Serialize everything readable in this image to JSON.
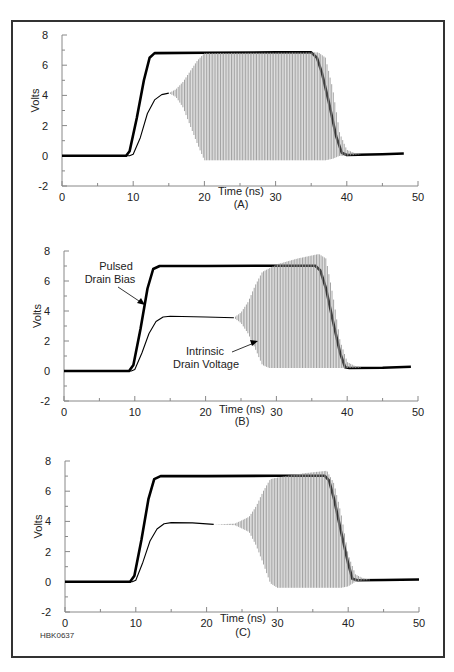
{
  "figure_id": "HBK0637",
  "chart_data": [
    {
      "type": "line",
      "panel": "(A)",
      "xlabel": "Time (ns)",
      "ylabel": "Volts",
      "xlim": [
        0,
        50
      ],
      "ylim": [
        -2,
        8
      ],
      "xticks": [
        0,
        10,
        20,
        30,
        40,
        50
      ],
      "yticks": [
        -2,
        0,
        2,
        4,
        6,
        8
      ],
      "grid": false,
      "series": [
        {
          "name": "Pulsed Drain Bias",
          "style": "thick-black",
          "points": [
            [
              0,
              0
            ],
            [
              9,
              0
            ],
            [
              9.5,
              0.3
            ],
            [
              10.5,
              2.5
            ],
            [
              11.5,
              5
            ],
            [
              12.3,
              6.5
            ],
            [
              13,
              6.8
            ],
            [
              20,
              6.82
            ],
            [
              30,
              6.85
            ],
            [
              35,
              6.85
            ],
            [
              35.8,
              6.5
            ],
            [
              36.5,
              5.5
            ],
            [
              37.5,
              3.5
            ],
            [
              38.5,
              1.3
            ],
            [
              39.3,
              0.2
            ],
            [
              40,
              0.05
            ],
            [
              45,
              0.1
            ],
            [
              48,
              0.15
            ]
          ]
        },
        {
          "name": "Intrinsic Drain Voltage",
          "style": "thin-black",
          "points": [
            [
              0,
              0
            ],
            [
              9.5,
              0
            ],
            [
              10,
              0.1
            ],
            [
              11,
              1.2
            ],
            [
              12,
              2.8
            ],
            [
              13,
              3.7
            ],
            [
              14,
              4.05
            ],
            [
              15,
              4.15
            ]
          ]
        },
        {
          "name": "Intrinsic Drain Voltage (oscillation envelope)",
          "style": "gray-oscillation",
          "upper": [
            [
              15,
              4.15
            ],
            [
              16,
              4.4
            ],
            [
              17,
              4.9
            ],
            [
              18,
              5.6
            ],
            [
              19,
              6.3
            ],
            [
              20,
              6.8
            ],
            [
              36,
              6.85
            ],
            [
              37,
              6.5
            ],
            [
              38,
              4.5
            ],
            [
              39,
              1.5
            ],
            [
              40,
              0.4
            ],
            [
              41,
              0.2
            ],
            [
              42,
              0.12
            ]
          ],
          "lower": [
            [
              15,
              4.15
            ],
            [
              16,
              3.9
            ],
            [
              17,
              3.2
            ],
            [
              18,
              2.0
            ],
            [
              19,
              0.8
            ],
            [
              20,
              -0.3
            ],
            [
              37,
              -0.3
            ],
            [
              38,
              -0.2
            ],
            [
              39,
              0.0
            ],
            [
              40,
              0.0
            ],
            [
              41,
              0.05
            ],
            [
              42,
              0.1
            ]
          ]
        }
      ]
    },
    {
      "type": "line",
      "panel": "(B)",
      "xlabel": "Time (ns)",
      "ylabel": "Volts",
      "xlim": [
        0,
        50
      ],
      "ylim": [
        -2,
        8
      ],
      "xticks": [
        0,
        10,
        20,
        30,
        40,
        50
      ],
      "yticks": [
        -2,
        0,
        2,
        4,
        6,
        8
      ],
      "grid": false,
      "annotations": [
        {
          "text": [
            "Pulsed",
            "Drain Bias"
          ],
          "target": "Pulsed Drain Bias"
        },
        {
          "text": [
            "Intrinsic",
            "Drain Voltage"
          ],
          "target": "Intrinsic Drain Voltage"
        }
      ],
      "series": [
        {
          "name": "Pulsed Drain Bias",
          "style": "thick-black",
          "points": [
            [
              0,
              0
            ],
            [
              9.2,
              0
            ],
            [
              9.8,
              0.4
            ],
            [
              10.8,
              2.8
            ],
            [
              11.8,
              5.5
            ],
            [
              12.6,
              6.8
            ],
            [
              13.5,
              7.0
            ],
            [
              20,
              7.0
            ],
            [
              30,
              7.02
            ],
            [
              35.5,
              7.02
            ],
            [
              36.2,
              6.7
            ],
            [
              37,
              5.5
            ],
            [
              38,
              3.3
            ],
            [
              39,
              1.2
            ],
            [
              39.7,
              0.25
            ],
            [
              40.3,
              0.2
            ],
            [
              45,
              0.22
            ],
            [
              49,
              0.28
            ]
          ]
        },
        {
          "name": "Intrinsic Drain Voltage",
          "style": "thin-black",
          "points": [
            [
              0,
              0
            ],
            [
              9.5,
              0
            ],
            [
              10,
              0.1
            ],
            [
              11,
              1.2
            ],
            [
              12,
              2.5
            ],
            [
              13,
              3.3
            ],
            [
              14,
              3.6
            ],
            [
              15,
              3.65
            ],
            [
              20,
              3.6
            ],
            [
              24,
              3.55
            ]
          ]
        },
        {
          "name": "Intrinsic Drain Voltage (oscillation envelope)",
          "style": "gray-oscillation",
          "upper": [
            [
              24,
              3.55
            ],
            [
              25,
              3.9
            ],
            [
              26,
              4.6
            ],
            [
              27,
              5.7
            ],
            [
              28,
              6.6
            ],
            [
              30,
              7.1
            ],
            [
              33,
              7.5
            ],
            [
              36,
              7.8
            ],
            [
              37,
              7.5
            ],
            [
              38,
              5.0
            ],
            [
              39,
              2.0
            ],
            [
              40,
              0.6
            ],
            [
              41,
              0.35
            ],
            [
              42,
              0.25
            ]
          ],
          "lower": [
            [
              24,
              3.55
            ],
            [
              25,
              3.2
            ],
            [
              26,
              2.5
            ],
            [
              27,
              1.5
            ],
            [
              28,
              0.4
            ],
            [
              29,
              0.2
            ],
            [
              38,
              0.2
            ],
            [
              39,
              0.2
            ],
            [
              40,
              0.2
            ],
            [
              41,
              0.2
            ],
            [
              42,
              0.22
            ]
          ]
        }
      ]
    },
    {
      "type": "line",
      "panel": "(C)",
      "xlabel": "Time (ns)",
      "ylabel": "Volts",
      "xlim": [
        0,
        50
      ],
      "ylim": [
        -2,
        8
      ],
      "xticks": [
        0,
        10,
        20,
        30,
        40,
        50
      ],
      "yticks": [
        -2,
        0,
        2,
        4,
        6,
        8
      ],
      "grid": false,
      "series": [
        {
          "name": "Pulsed Drain Bias",
          "style": "thick-black",
          "points": [
            [
              0,
              0
            ],
            [
              9.2,
              0
            ],
            [
              9.8,
              0.4
            ],
            [
              10.8,
              2.8
            ],
            [
              11.8,
              5.5
            ],
            [
              12.6,
              6.8
            ],
            [
              13.5,
              7.0
            ],
            [
              20,
              7.0
            ],
            [
              30,
              7.02
            ],
            [
              36.7,
              7.02
            ],
            [
              37.3,
              6.7
            ],
            [
              38,
              5.5
            ],
            [
              39,
              3.3
            ],
            [
              40,
              1.2
            ],
            [
              40.6,
              0.2
            ],
            [
              41.3,
              0.1
            ],
            [
              45,
              0.12
            ],
            [
              50,
              0.15
            ]
          ]
        },
        {
          "name": "Intrinsic Drain Voltage",
          "style": "thin-black",
          "points": [
            [
              0,
              0
            ],
            [
              9.5,
              0
            ],
            [
              10,
              0.1
            ],
            [
              11,
              1.3
            ],
            [
              12,
              2.7
            ],
            [
              13,
              3.5
            ],
            [
              14,
              3.85
            ],
            [
              15,
              3.92
            ],
            [
              18,
              3.9
            ],
            [
              21,
              3.8
            ]
          ]
        },
        {
          "name": "Intrinsic Drain Voltage (oscillation envelope)",
          "style": "gray-oscillation",
          "upper": [
            [
              21,
              3.8
            ],
            [
              24,
              3.85
            ],
            [
              26,
              4.3
            ],
            [
              27,
              5.0
            ],
            [
              28,
              6.0
            ],
            [
              29,
              6.8
            ],
            [
              31,
              7.0
            ],
            [
              34,
              7.2
            ],
            [
              37,
              7.35
            ],
            [
              38,
              6.5
            ],
            [
              39,
              4.5
            ],
            [
              40,
              1.8
            ],
            [
              41,
              0.5
            ],
            [
              42,
              0.25
            ],
            [
              43,
              0.15
            ]
          ],
          "lower": [
            [
              21,
              3.8
            ],
            [
              24,
              3.75
            ],
            [
              26,
              3.3
            ],
            [
              27,
              2.4
            ],
            [
              28,
              1.2
            ],
            [
              29,
              -0.1
            ],
            [
              30,
              -0.4
            ],
            [
              39,
              -0.4
            ],
            [
              40,
              -0.3
            ],
            [
              41,
              0.0
            ],
            [
              42,
              0.08
            ],
            [
              43,
              0.1
            ]
          ]
        }
      ]
    }
  ]
}
